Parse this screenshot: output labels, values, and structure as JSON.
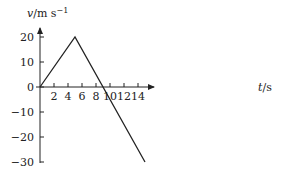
{
  "chart_data": {
    "type": "line",
    "title": "",
    "xlabel": "t/s",
    "ylabel": "v/m s⁻¹",
    "xlabel_parts": {
      "var": "t",
      "unit": "/s"
    },
    "ylabel_parts": {
      "var": "v",
      "unit": "/m s",
      "sup": "−1"
    },
    "xlim": [
      0,
      16
    ],
    "ylim": [
      -30,
      22
    ],
    "xticks": [
      2,
      4,
      6,
      8,
      10,
      12,
      14
    ],
    "xtick_labels": [
      "2",
      "4",
      "6",
      "8",
      "10",
      "12",
      "14"
    ],
    "yticks": [
      20,
      10,
      0,
      -10,
      -20,
      -30
    ],
    "ytick_labels": [
      "20",
      "10",
      "0",
      "−10",
      "−20",
      "−30"
    ],
    "grid": false,
    "series": [
      {
        "name": "velocity",
        "x": [
          0,
          5,
          15
        ],
        "y": [
          0,
          20,
          -30
        ]
      }
    ]
  }
}
